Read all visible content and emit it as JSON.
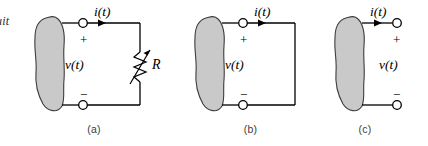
{
  "figure": {
    "clipped_text": "uit",
    "colors": {
      "blob_fill": "#c9c9c9",
      "blob_stroke": "#3d3d3d",
      "wire": "#000000",
      "terminal_fill": "#ffffff",
      "caption": "#3a3a3a",
      "background": "#ffffff"
    },
    "panels": [
      {
        "id": "a",
        "caption": "(a)",
        "current_label": "i(t)",
        "voltage_label": "v(t)",
        "plus_sign": "+",
        "minus_sign": "−",
        "component_label": "R",
        "component_type": "variable-resistor",
        "circuit_state": "loaded"
      },
      {
        "id": "b",
        "caption": "(b)",
        "current_label": "i(t)",
        "voltage_label": "v(t)",
        "plus_sign": "+",
        "minus_sign": "−",
        "component_label": "",
        "component_type": "none",
        "circuit_state": "short-circuit"
      },
      {
        "id": "c",
        "caption": "(c)",
        "current_label": "i(t)",
        "voltage_label": "v(t)",
        "plus_sign": "+",
        "minus_sign": "−",
        "component_label": "",
        "component_type": "none",
        "circuit_state": "open-circuit"
      }
    ]
  }
}
